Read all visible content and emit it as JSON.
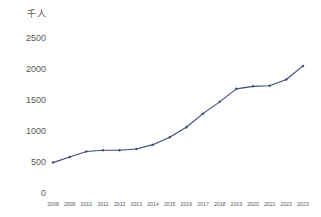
{
  "chart_data": {
    "type": "line",
    "title": "",
    "subtitle": "",
    "xlabel": "",
    "ylabel": "千人",
    "unit_label": "千人",
    "categories": [
      "2008",
      "2009",
      "2010",
      "2011",
      "2012",
      "2013",
      "2014",
      "2015",
      "2016",
      "2017",
      "2018",
      "2019",
      "2020",
      "2021",
      "2022",
      "2023"
    ],
    "values": [
      490,
      580,
      670,
      690,
      690,
      710,
      780,
      900,
      1060,
      1280,
      1470,
      1680,
      1720,
      1730,
      1830,
      2050
    ],
    "series": [
      {
        "name": "千人",
        "values": [
          490,
          580,
          670,
          690,
          690,
          710,
          780,
          900,
          1060,
          1280,
          1470,
          1680,
          1720,
          1730,
          1830,
          2050
        ]
      }
    ],
    "ylim": [
      0,
      2500
    ],
    "yticks": [
      0,
      500,
      1000,
      1500,
      2000,
      2500
    ],
    "ytick_labels": [
      "0",
      "500",
      "1000",
      "1500",
      "2000",
      "2500"
    ],
    "grid": false,
    "legend": "none",
    "line_color": "#3c4a77",
    "marker_color": "#3c4a77",
    "marker_shape": "diamond",
    "background_color": "#ffffff",
    "text_color": "#5a5a5a"
  },
  "axis": {
    "y_unit": "千人",
    "y_ticks": [
      {
        "label": "2500",
        "value": 2500
      },
      {
        "label": "2000",
        "value": 2000
      },
      {
        "label": "1500",
        "value": 1500
      },
      {
        "label": "1000",
        "value": 1000
      },
      {
        "label": "500",
        "value": 500
      },
      {
        "label": "0",
        "value": 0
      }
    ],
    "x_ticks": [
      {
        "label": "2008"
      },
      {
        "label": "2009"
      },
      {
        "label": "2010"
      },
      {
        "label": "2011"
      },
      {
        "label": "2012"
      },
      {
        "label": "2013"
      },
      {
        "label": "2014"
      },
      {
        "label": "2015"
      },
      {
        "label": "2016"
      },
      {
        "label": "2017"
      },
      {
        "label": "2018"
      },
      {
        "label": "2019"
      },
      {
        "label": "2020"
      },
      {
        "label": "2021"
      },
      {
        "label": "2022"
      },
      {
        "label": "2023"
      }
    ]
  }
}
